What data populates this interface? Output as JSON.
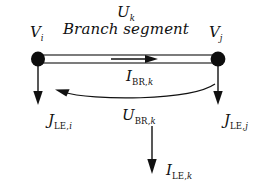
{
  "figure": {
    "name": "branch-segment-diagram",
    "background_color": "#ffffff",
    "ink_color": "#111111"
  },
  "labels": {
    "branch_voltage_top": {
      "base": "U",
      "subscript": "k",
      "subscript_style": "italic"
    },
    "caption": "Branch segment",
    "node_left": {
      "base": "V",
      "subscript": "i",
      "subscript_style": "italic"
    },
    "node_right": {
      "base": "V",
      "subscript": "j",
      "subscript_style": "italic"
    },
    "branch_current": {
      "base": "I",
      "subscript_roman": "BR,",
      "subscript_italic": "k"
    },
    "branch_voltage_drop": {
      "base": "U",
      "subscript_roman": "BR,",
      "subscript_italic": "k"
    },
    "leakage_current_left": {
      "base": "J",
      "subscript_roman": "LE,",
      "subscript_italic": "i"
    },
    "leakage_current_right": {
      "base": "J",
      "subscript_roman": "LE,",
      "subscript_italic": "j"
    },
    "leakage_current_branch": {
      "base": "I",
      "subscript_roman": "LE,",
      "subscript_italic": "k"
    }
  },
  "geometry": {
    "branch_bar": {
      "x1": 38,
      "x2": 218,
      "top": 55,
      "bottom": 63
    },
    "node_left": {
      "cx": 38,
      "cy": 59,
      "rx": 7,
      "ry": 7.5
    },
    "node_right": {
      "cx": 218,
      "cy": 59,
      "rx": 7.5,
      "ry": 7.5
    },
    "current_arrow": {
      "x1": 111,
      "x2": 157,
      "y": 59,
      "direction": "right"
    },
    "return_arc": {
      "from_x": 215,
      "from_y": 84,
      "to_x": 56,
      "to_y": 90,
      "direction": "left"
    },
    "down_arrow_left": {
      "x": 38,
      "y1": 63,
      "y2": 104
    },
    "down_arrow_right": {
      "x": 218,
      "y1": 63,
      "y2": 104
    },
    "down_arrow_center": {
      "x": 152,
      "y1": 126,
      "y2": 173
    }
  }
}
